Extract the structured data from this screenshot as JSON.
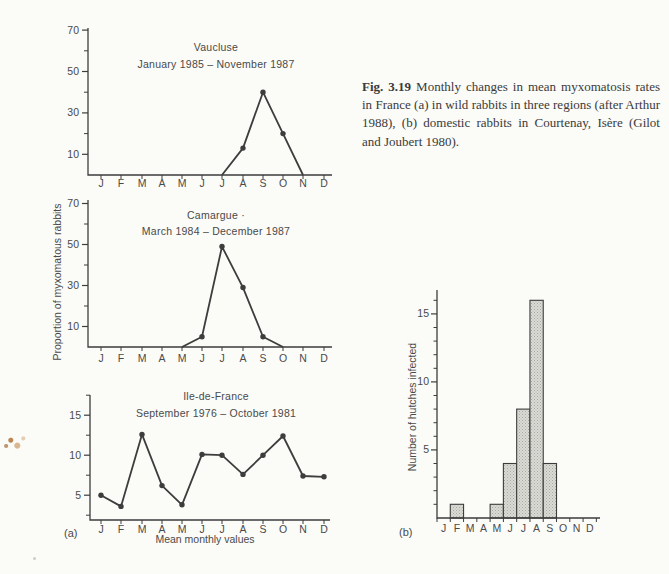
{
  "page": {
    "background": "#fbfbf8",
    "ink": "#3d3d3d"
  },
  "caption": {
    "label": "Fig. 3.19",
    "text": "Monthly changes in mean myxomatosis rates in France (a) in wild rabbits in three regions (after Arthur 1988), (b) domestic rabbits in Courtenay, Isère (Gilot and Joubert 1980)."
  },
  "panel_a": {
    "label": "(a)",
    "ylabel": "Proportion of myxomatous rabbits",
    "xlabel": "Mean monthly values"
  },
  "panel_b": {
    "label": "(b)"
  },
  "months": [
    "J",
    "F",
    "M",
    "A",
    "M",
    "J",
    "J",
    "A",
    "S",
    "O",
    "N",
    "D"
  ],
  "chart_data": [
    {
      "id": "vaucluse",
      "type": "line",
      "title": "Vaucluse",
      "subtitle": "January 1985 – November 1987",
      "categories": [
        "J",
        "F",
        "M",
        "A",
        "M",
        "J",
        "J",
        "A",
        "S",
        "O",
        "N",
        "D"
      ],
      "values": [
        null,
        null,
        null,
        null,
        null,
        null,
        0,
        13,
        40,
        20,
        0,
        null
      ],
      "markers": [
        7,
        8,
        9
      ],
      "ylim": [
        0,
        71
      ],
      "yticks_major": [
        10,
        30,
        50,
        70
      ],
      "yticks_minor": [
        20,
        40,
        60
      ],
      "grid": false
    },
    {
      "id": "camargue",
      "type": "line",
      "title": "Camargue ·",
      "subtitle": "March 1984 – December 1987",
      "categories": [
        "J",
        "F",
        "M",
        "A",
        "M",
        "J",
        "J",
        "A",
        "S",
        "O",
        "N",
        "D"
      ],
      "values": [
        null,
        null,
        null,
        null,
        0,
        5,
        49,
        29,
        5,
        0,
        null,
        null
      ],
      "markers": [
        5,
        6,
        7,
        8
      ],
      "ylim": [
        0,
        72
      ],
      "yticks_major": [
        10,
        30,
        50,
        70
      ],
      "yticks_minor": [
        20,
        40,
        60
      ],
      "grid": false
    },
    {
      "id": "ile-de-france",
      "type": "line",
      "title": "Ile-de-France",
      "subtitle": "September 1976 – October 1981",
      "xlabel": "Mean monthly values",
      "categories": [
        "J",
        "F",
        "M",
        "A",
        "M",
        "J",
        "J",
        "A",
        "S",
        "O",
        "N",
        "D"
      ],
      "values": [
        5.0,
        3.6,
        12.6,
        6.2,
        3.8,
        10.1,
        10.0,
        7.6,
        10.0,
        12.4,
        7.4,
        7.3
      ],
      "markers": [
        0,
        1,
        2,
        3,
        4,
        5,
        6,
        7,
        8,
        9,
        10,
        11
      ],
      "ylim": [
        1.9,
        17.5
      ],
      "yticks_major": [
        5,
        10,
        15
      ],
      "yticks_minor": [
        2.5,
        7.5,
        12.5,
        17.5
      ],
      "grid": false
    },
    {
      "id": "hutches",
      "type": "bar",
      "ylabel": "Number of hutches infected",
      "categories": [
        "J",
        "F",
        "M",
        "A",
        "M",
        "J",
        "J",
        "A",
        "S",
        "O",
        "N",
        "D"
      ],
      "values": [
        0,
        1,
        0,
        0,
        1,
        4,
        8,
        16,
        4,
        0,
        0,
        0
      ],
      "ylim": [
        0,
        16.8
      ],
      "yticks_major": [
        5,
        10,
        15
      ],
      "yticks_minor": [
        1,
        2,
        3,
        4,
        6,
        7,
        8,
        9,
        11,
        12,
        13,
        14,
        16
      ],
      "bar_fill": "#dbdbd6",
      "bar_stipple": "#a9a9a1",
      "grid": false
    }
  ]
}
